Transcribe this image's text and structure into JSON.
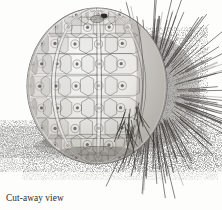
{
  "figure": {
    "title": "Cut-away view showing urchin's test",
    "medium": "pen-and-ink stipple line illustration",
    "background_color": "#fdfdfc",
    "ink_color": "#2b2a28",
    "caption": {
      "line1": "Cut-away view",
      "line2": "showing urchin's test"
    },
    "parts": [
      {
        "name": "test",
        "label": "urchin's test",
        "description": "bare calcareous shell, left half, polygonal plates with central tubercles"
      },
      {
        "name": "spines",
        "label": "spines",
        "description": "dense radiating spines covering right half"
      },
      {
        "name": "apical-opening",
        "label": "periproct",
        "description": "small dark aperture near apex"
      },
      {
        "name": "substrate",
        "label": "ground",
        "description": "stippled sea floor and cast shadow"
      }
    ]
  },
  "art": {
    "test": {
      "center_x": 97,
      "center_y": 86,
      "radius_x": 70,
      "radius_y": 78,
      "plate_rows": 11,
      "plate_columns": 10,
      "suture_bands": 5
    },
    "spines": {
      "origin_x": 150,
      "origin_y": 92,
      "count": 190,
      "min_length": 16,
      "max_length": 62
    },
    "ground": {
      "line_y": 150,
      "shadow_opacity": 0.55
    }
  }
}
